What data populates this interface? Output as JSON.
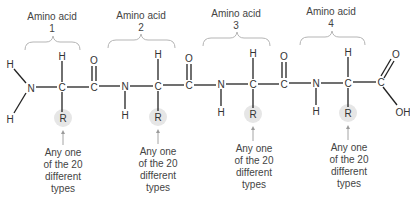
{
  "diagram": {
    "amino_acids": [
      {
        "label_line1": "Amino acid",
        "label_line2": "1"
      },
      {
        "label_line1": "Amino acid",
        "label_line2": "2"
      },
      {
        "label_line1": "Amino acid",
        "label_line2": "3"
      },
      {
        "label_line1": "Amino acid",
        "label_line2": "4"
      }
    ],
    "atoms": {
      "N": "N",
      "C": "C",
      "H": "H",
      "O": "O",
      "R": "R",
      "OH": "OH"
    },
    "r_group_note": {
      "line1": "Any one",
      "line2": "of the 20",
      "line3": "different",
      "line4": "types"
    },
    "colors": {
      "bond": "#222222",
      "text": "#333333",
      "brace": "#b5b5b5",
      "r_highlight": "#e6e6e6",
      "arrow": "#9a9a9a"
    }
  }
}
